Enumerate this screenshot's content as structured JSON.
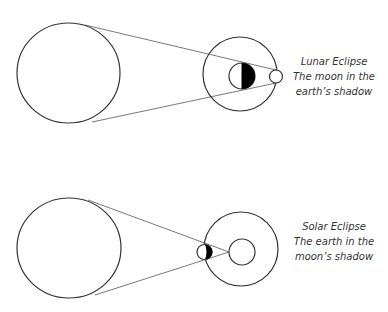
{
  "diagrams": [
    {
      "name": "lunar-eclipse",
      "caption": [
        "Lunar Eclipse",
        "The moon in the",
        "earth’s shadow"
      ]
    },
    {
      "name": "solar-eclipse",
      "caption": [
        "Solar Eclipse",
        "The earth in the",
        "moon’s shadow"
      ]
    }
  ],
  "colors": {
    "stroke": "#333333",
    "fill_dark": "#000000",
    "background": "#ffffff"
  }
}
